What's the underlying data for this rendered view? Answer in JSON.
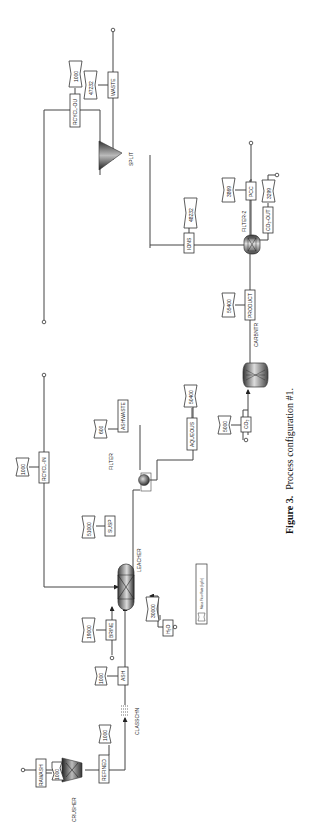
{
  "figure": {
    "caption_label": "Figure 3.",
    "caption_text": "Process configuration #1.",
    "orientation": "rotated 90 degrees counter-clockwise"
  },
  "units": {
    "RAWASH": "CRUSHER",
    "labels": {
      "crusher": "CRUSHER",
      "classifier": "CLASSCHN",
      "leacher": "LEACHER",
      "filter": "FILTER",
      "carbonator": "CARBNTR",
      "filter2": "FILTER-2",
      "split": "SPLIT"
    }
  },
  "streams": [
    {
      "id": "rawash",
      "name": "RAWASH",
      "flow": "1000"
    },
    {
      "id": "refined",
      "name": "REFINED",
      "flow": "1000"
    },
    {
      "id": "ash",
      "name": "ASH",
      "flow": "1000"
    },
    {
      "id": "brine",
      "name": "BRINE",
      "flow": "19000"
    },
    {
      "id": "h2o",
      "name": "H₂O",
      "flow": "30000"
    },
    {
      "id": "rcycl_in",
      "name": "RCYCL-IN",
      "flow": "1000"
    },
    {
      "id": "susp",
      "name": "SUSP",
      "flow": "51000"
    },
    {
      "id": "ashwaste",
      "name": "ASHWASTE",
      "flow": "600"
    },
    {
      "id": "aqueous",
      "name": "AQUEOUS",
      "flow": "50400"
    },
    {
      "id": "co2",
      "name": "CO₂",
      "flow": "5000"
    },
    {
      "id": "product",
      "name": "PRODUCT",
      "flow": "55400"
    },
    {
      "id": "ions",
      "name": "IONS",
      "flow": "48232"
    },
    {
      "id": "pcc",
      "name": "PCC",
      "flow": "3869"
    },
    {
      "id": "co2_out",
      "name": "CO₂-OUT",
      "flow": "3299"
    },
    {
      "id": "waste",
      "name": "WASTE",
      "flow": "47232"
    },
    {
      "id": "rcycl_ou",
      "name": "RCYCL-OU",
      "flow": "1000"
    }
  ],
  "legend": {
    "text": "Mass Flow Rate (kg/hr)"
  }
}
